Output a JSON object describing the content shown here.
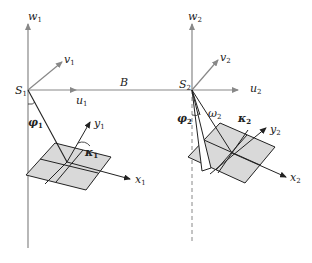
{
  "diagram": {
    "type": "stereo photogrammetry relative orientation",
    "baseline_label": "B",
    "left": {
      "station": {
        "base": "S",
        "sub": "1"
      },
      "axes": {
        "w": {
          "base": "w",
          "sub": "1"
        },
        "v": {
          "base": "v",
          "sub": "1"
        },
        "u": {
          "base": "u",
          "sub": "1"
        },
        "x": {
          "base": "x",
          "sub": "1"
        },
        "y": {
          "base": "y",
          "sub": "1"
        }
      },
      "angles": {
        "phi": {
          "base": "φ",
          "sub": "1"
        },
        "kappa": {
          "base": "κ",
          "sub": "1"
        }
      }
    },
    "right": {
      "station": {
        "base": "S",
        "sub": "2"
      },
      "axes": {
        "w": {
          "base": "w",
          "sub": "2"
        },
        "v": {
          "base": "v",
          "sub": "2"
        },
        "u": {
          "base": "u",
          "sub": "2"
        },
        "x": {
          "base": "x",
          "sub": "2"
        },
        "y": {
          "base": "y",
          "sub": "2"
        }
      },
      "angles": {
        "phi": {
          "base": "φ",
          "sub": "2"
        },
        "omega": {
          "base": "ω",
          "sub": "2"
        },
        "kappa": {
          "base": "κ",
          "sub": "2"
        }
      }
    },
    "colors": {
      "axis_gray": "#888888",
      "line_dark": "#222222",
      "plane_fill": "#d9d9d9",
      "wedge_fill": "#ffffff"
    }
  }
}
